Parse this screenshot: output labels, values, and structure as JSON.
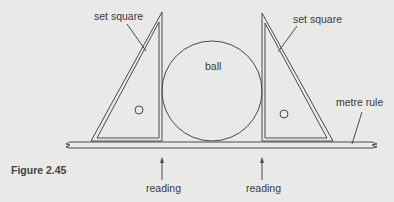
{
  "figure": {
    "caption": "Figure 2.45",
    "labels": {
      "set_square_left": "set square",
      "set_square_right": "set square",
      "ball": "ball",
      "metre_rule": "metre rule",
      "reading_left": "reading",
      "reading_right": "reading"
    },
    "colors": {
      "background": "#e9e9e7",
      "line": "#4a4a4a"
    }
  }
}
